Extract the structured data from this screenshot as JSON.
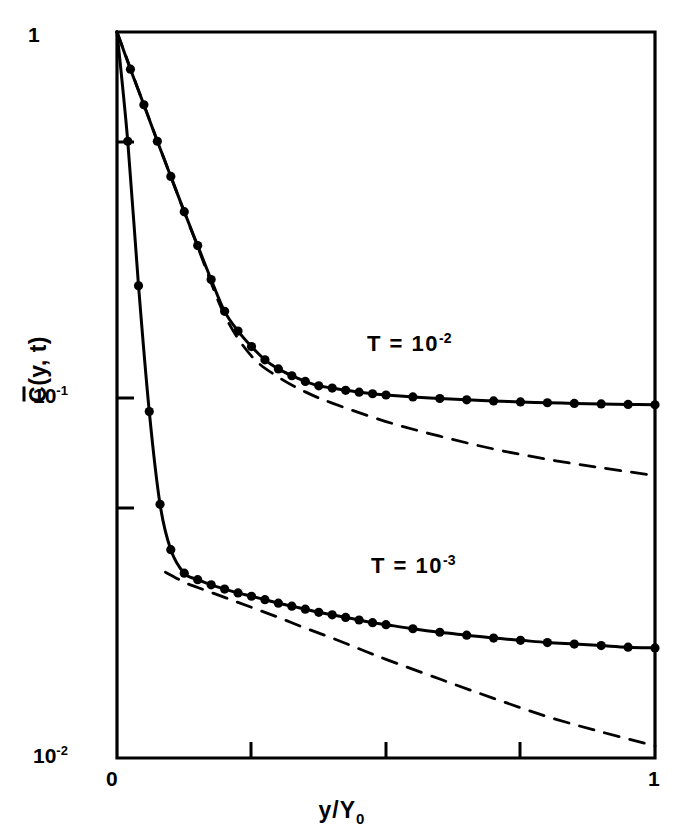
{
  "figure": {
    "background_color": "#ffffff",
    "ink_color": "#000000"
  },
  "axes": {
    "x": {
      "title": "y/Y",
      "title_subscript": "0",
      "tick_labels": [
        "0",
        "1"
      ],
      "minor_tick_positions": [
        0.25,
        0.5,
        0.75
      ],
      "range": [
        0,
        1
      ],
      "scale": "linear"
    },
    "y": {
      "title_prefix": "C",
      "title_suffix": "(y, t)",
      "tick_labels": [
        "1",
        "10",
        "10"
      ],
      "exponent_01": "-1",
      "exponent_001": "-2",
      "minor_tick_values": [
        0.5,
        0.05
      ],
      "range": [
        0.01,
        1
      ],
      "scale": "log"
    }
  },
  "annotations": [
    {
      "name": "upper-curve-label",
      "text": "T = 10",
      "exponent": "-2"
    },
    {
      "name": "lower-curve-label",
      "text": "T = 10",
      "exponent": "-3"
    }
  ],
  "chart_data": {
    "type": "line",
    "title": "",
    "xlabel": "y/Y_0",
    "ylabel": "C̄(y, t)",
    "xlim": [
      0,
      1
    ],
    "ylim": [
      0.01,
      1
    ],
    "xscale": "linear",
    "yscale": "log",
    "grid": false,
    "legend": "none",
    "annotations": [
      "T = 10^-2",
      "T = 10^-3"
    ],
    "series": [
      {
        "name": "T = 10^-2 (solid, with markers)",
        "style": "solid",
        "marker": "filled-circle",
        "x": [
          0.0,
          0.025,
          0.05,
          0.075,
          0.1,
          0.125,
          0.15,
          0.175,
          0.2,
          0.225,
          0.25,
          0.275,
          0.3,
          0.325,
          0.35,
          0.375,
          0.4,
          0.425,
          0.45,
          0.475,
          0.5,
          0.55,
          0.6,
          0.65,
          0.7,
          0.75,
          0.8,
          0.85,
          0.9,
          0.95,
          1.0
        ],
        "y": [
          1.0,
          0.79,
          0.63,
          0.5,
          0.4,
          0.32,
          0.258,
          0.208,
          0.17,
          0.15,
          0.136,
          0.125,
          0.118,
          0.113,
          0.109,
          0.106,
          0.1045,
          0.103,
          0.1018,
          0.1008,
          0.1,
          0.0988,
          0.0978,
          0.097,
          0.0963,
          0.0957,
          0.0952,
          0.0948,
          0.0945,
          0.0942,
          0.094
        ]
      },
      {
        "name": "T = 10^-2 (dashed, asymptote)",
        "style": "dashed",
        "marker": "none",
        "x": [
          0.0,
          0.05,
          0.1,
          0.15,
          0.2,
          0.25,
          0.3,
          0.35,
          0.4,
          0.5,
          0.6,
          0.7,
          0.8,
          0.9,
          1.0
        ],
        "y": [
          1.0,
          0.63,
          0.4,
          0.256,
          0.166,
          0.128,
          0.112,
          0.102,
          0.095,
          0.0845,
          0.077,
          0.071,
          0.0665,
          0.063,
          0.06
        ]
      },
      {
        "name": "T = 10^-3 (solid, with markers)",
        "style": "solid",
        "marker": "filled-circle",
        "x": [
          0.0,
          0.02,
          0.04,
          0.06,
          0.08,
          0.1,
          0.125,
          0.15,
          0.175,
          0.2,
          0.225,
          0.25,
          0.275,
          0.3,
          0.325,
          0.35,
          0.375,
          0.4,
          0.425,
          0.45,
          0.475,
          0.5,
          0.55,
          0.6,
          0.65,
          0.7,
          0.75,
          0.8,
          0.85,
          0.9,
          0.95,
          1.0
        ],
        "y": [
          1.0,
          0.5,
          0.2,
          0.09,
          0.05,
          0.0375,
          0.0323,
          0.031,
          0.03,
          0.0292,
          0.0285,
          0.0279,
          0.0273,
          0.0267,
          0.0262,
          0.0257,
          0.0252,
          0.0248,
          0.0244,
          0.024,
          0.0236,
          0.0233,
          0.0227,
          0.0222,
          0.0218,
          0.0214,
          0.0211,
          0.0208,
          0.0206,
          0.0204,
          0.0202,
          0.0201
        ]
      },
      {
        "name": "T = 10^-3 (dashed, asymptote)",
        "style": "dashed",
        "marker": "none",
        "x": [
          0.09,
          0.125,
          0.15,
          0.2,
          0.25,
          0.3,
          0.35,
          0.4,
          0.45,
          0.5,
          0.6,
          0.7,
          0.8,
          0.9,
          1.0
        ],
        "y": [
          0.0325,
          0.0305,
          0.0295,
          0.0277,
          0.026,
          0.0244,
          0.0228,
          0.0214,
          0.02,
          0.0187,
          0.0165,
          0.0146,
          0.013,
          0.0118,
          0.0108
        ]
      }
    ]
  }
}
